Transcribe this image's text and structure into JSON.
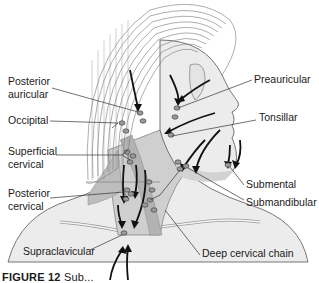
{
  "figure": {
    "labels": {
      "posterior_auricular": [
        "Posterior",
        "auricular"
      ],
      "occipital": "Occipital",
      "superficial_cervical": [
        "Superficial",
        "cervical"
      ],
      "posterior_cervical": [
        "Posterior",
        "cervical"
      ],
      "supraclavicular": "Supraclavicular",
      "preauricular": "Preauricular",
      "tonsillar": "Tonsillar",
      "submental": "Submental",
      "submandibular": "Submandibular",
      "deep_cervical_chain": "Deep cervical chain"
    },
    "caption": {
      "prefix": "FIGURE 12",
      "text": "Sub...",
      "truncated": true
    },
    "colors": {
      "line": "#333333",
      "skin": "#ececec",
      "neck_shade": "#c9c9c9",
      "muscle": "#b5b5b5",
      "arrow": "#111111",
      "node": "#8a8a8a"
    }
  }
}
